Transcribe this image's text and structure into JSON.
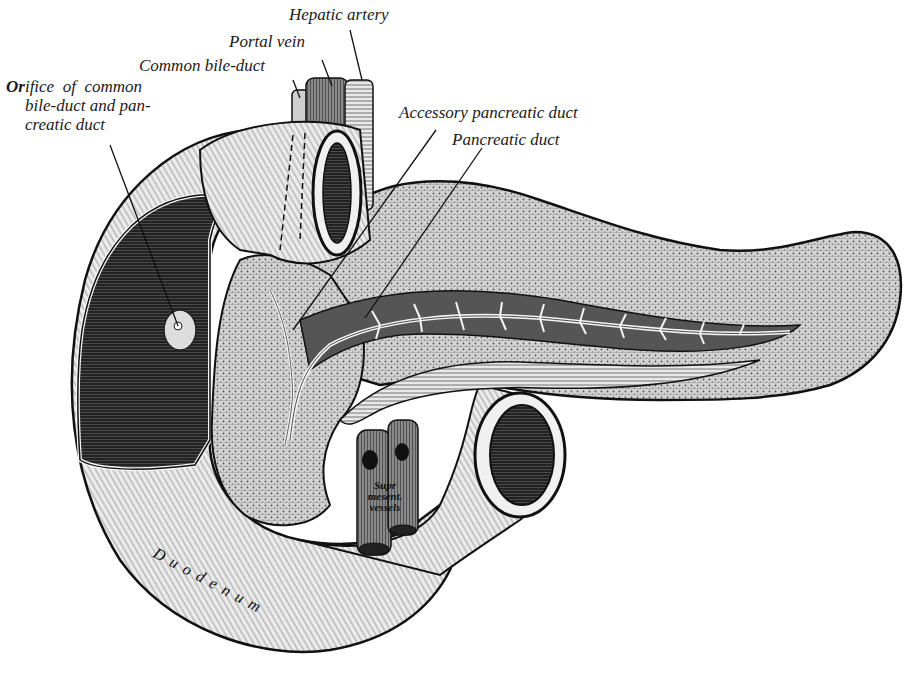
{
  "figure": {
    "style": "black-and-white line engraving",
    "background": "#ffffff",
    "ink": "#1a1a1a"
  },
  "labels": {
    "hepatic_artery": "Hepatic artery",
    "portal_vein": "Portal vein",
    "common_bile_duct": "Common bile-duct",
    "orifice": {
      "line1_bold": "Or",
      "line1_rest": "ifice  of  common",
      "line2": "bile-duct and pan-",
      "line3": "creatic duct"
    },
    "accessory_pancreatic_duct": "Accessory pancreatic duct",
    "pancreatic_duct": "Pancreatic duct",
    "supr_mesent_vessels": {
      "line1": "Supr",
      "line2": "mesent.",
      "line3": "vessels"
    },
    "duodenum": "Duodenum"
  }
}
